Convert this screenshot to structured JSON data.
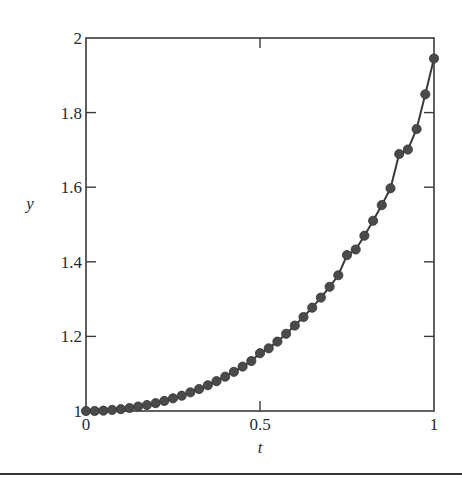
{
  "chart_data": {
    "type": "line",
    "title": "",
    "xlabel": "t",
    "ylabel": "y",
    "xlim": [
      0,
      1
    ],
    "ylim": [
      1,
      2
    ],
    "xticks": [
      0,
      0.5,
      1
    ],
    "xtick_labels": [
      "0",
      "0.5",
      "1"
    ],
    "yticks": [
      1,
      1.2,
      1.4,
      1.6,
      1.8,
      2
    ],
    "ytick_labels": [
      "1",
      "1.2",
      "1.4",
      "1.6",
      "1.8",
      "2"
    ],
    "grid": false,
    "legend": null,
    "series": [
      {
        "name": "y(t)",
        "marker": "circle",
        "line": true,
        "color": "#3a3a3a",
        "x": [
          0,
          0.025,
          0.05,
          0.075,
          0.1,
          0.125,
          0.15,
          0.175,
          0.2,
          0.225,
          0.25,
          0.275,
          0.3,
          0.325,
          0.35,
          0.375,
          0.4,
          0.425,
          0.45,
          0.475,
          0.5,
          0.525,
          0.55,
          0.575,
          0.6,
          0.625,
          0.65,
          0.675,
          0.7,
          0.725,
          0.75,
          0.775,
          0.8,
          0.825,
          0.85,
          0.875,
          0.9,
          0.925,
          0.95,
          0.975,
          1
        ],
        "values": [
          1.0,
          1.0,
          1.001,
          1.003,
          1.005,
          1.008,
          1.012,
          1.016,
          1.021,
          1.027,
          1.034,
          1.041,
          1.05,
          1.059,
          1.069,
          1.08,
          1.092,
          1.105,
          1.119,
          1.134,
          1.155,
          1.168,
          1.186,
          1.207,
          1.229,
          1.252,
          1.277,
          1.304,
          1.333,
          1.364,
          1.418,
          1.433,
          1.47,
          1.51,
          1.552,
          1.597,
          1.689,
          1.701,
          1.756,
          1.849,
          1.945
        ]
      }
    ]
  },
  "labels": {
    "x_axis": "t",
    "y_axis": "y"
  }
}
